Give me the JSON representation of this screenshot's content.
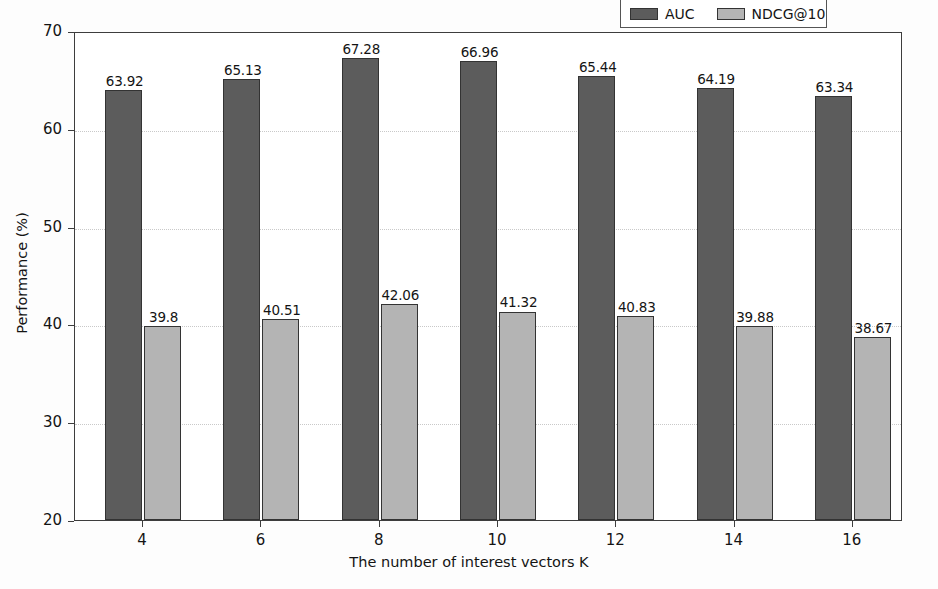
{
  "chart_data": {
    "type": "bar",
    "title": "",
    "xlabel": "The number of interest vectors K",
    "ylabel": "Performance (%)",
    "categories": [
      "4",
      "6",
      "8",
      "10",
      "12",
      "14",
      "16"
    ],
    "series": [
      {
        "name": "AUC",
        "color": "#5c5c5c",
        "values": [
          63.92,
          65.13,
          67.28,
          66.96,
          65.44,
          64.19,
          63.34
        ]
      },
      {
        "name": "NDCG@10",
        "color": "#b4b4b4",
        "values": [
          39.8,
          40.51,
          42.06,
          41.32,
          40.83,
          39.88,
          38.67
        ]
      }
    ],
    "value_labels": {
      "AUC": [
        "63.92",
        "65.13",
        "67.28",
        "66.96",
        "65.44",
        "64.19",
        "63.34"
      ],
      "NDCG@10": [
        "39.8",
        "40.51",
        "42.06",
        "41.32",
        "40.83",
        "39.88",
        "38.67"
      ]
    },
    "ylim": [
      20,
      70
    ],
    "yticks": [
      20,
      30,
      40,
      50,
      60,
      70
    ],
    "ytick_labels": [
      "20",
      "30",
      "40",
      "50",
      "60",
      "70"
    ],
    "xtick_labels": [
      "4",
      "6",
      "8",
      "10",
      "12",
      "14",
      "16"
    ],
    "grid": true,
    "grid_axis": "y",
    "grid_style": "dotted",
    "legend_position": "top-right",
    "legend_entries": [
      "AUC",
      "NDCG@10"
    ],
    "background_color": "#fdfdfd",
    "plot_background_color": "#ffffff",
    "axis_color": "#3d3d3d",
    "grid_color": "#c9c9c9"
  }
}
